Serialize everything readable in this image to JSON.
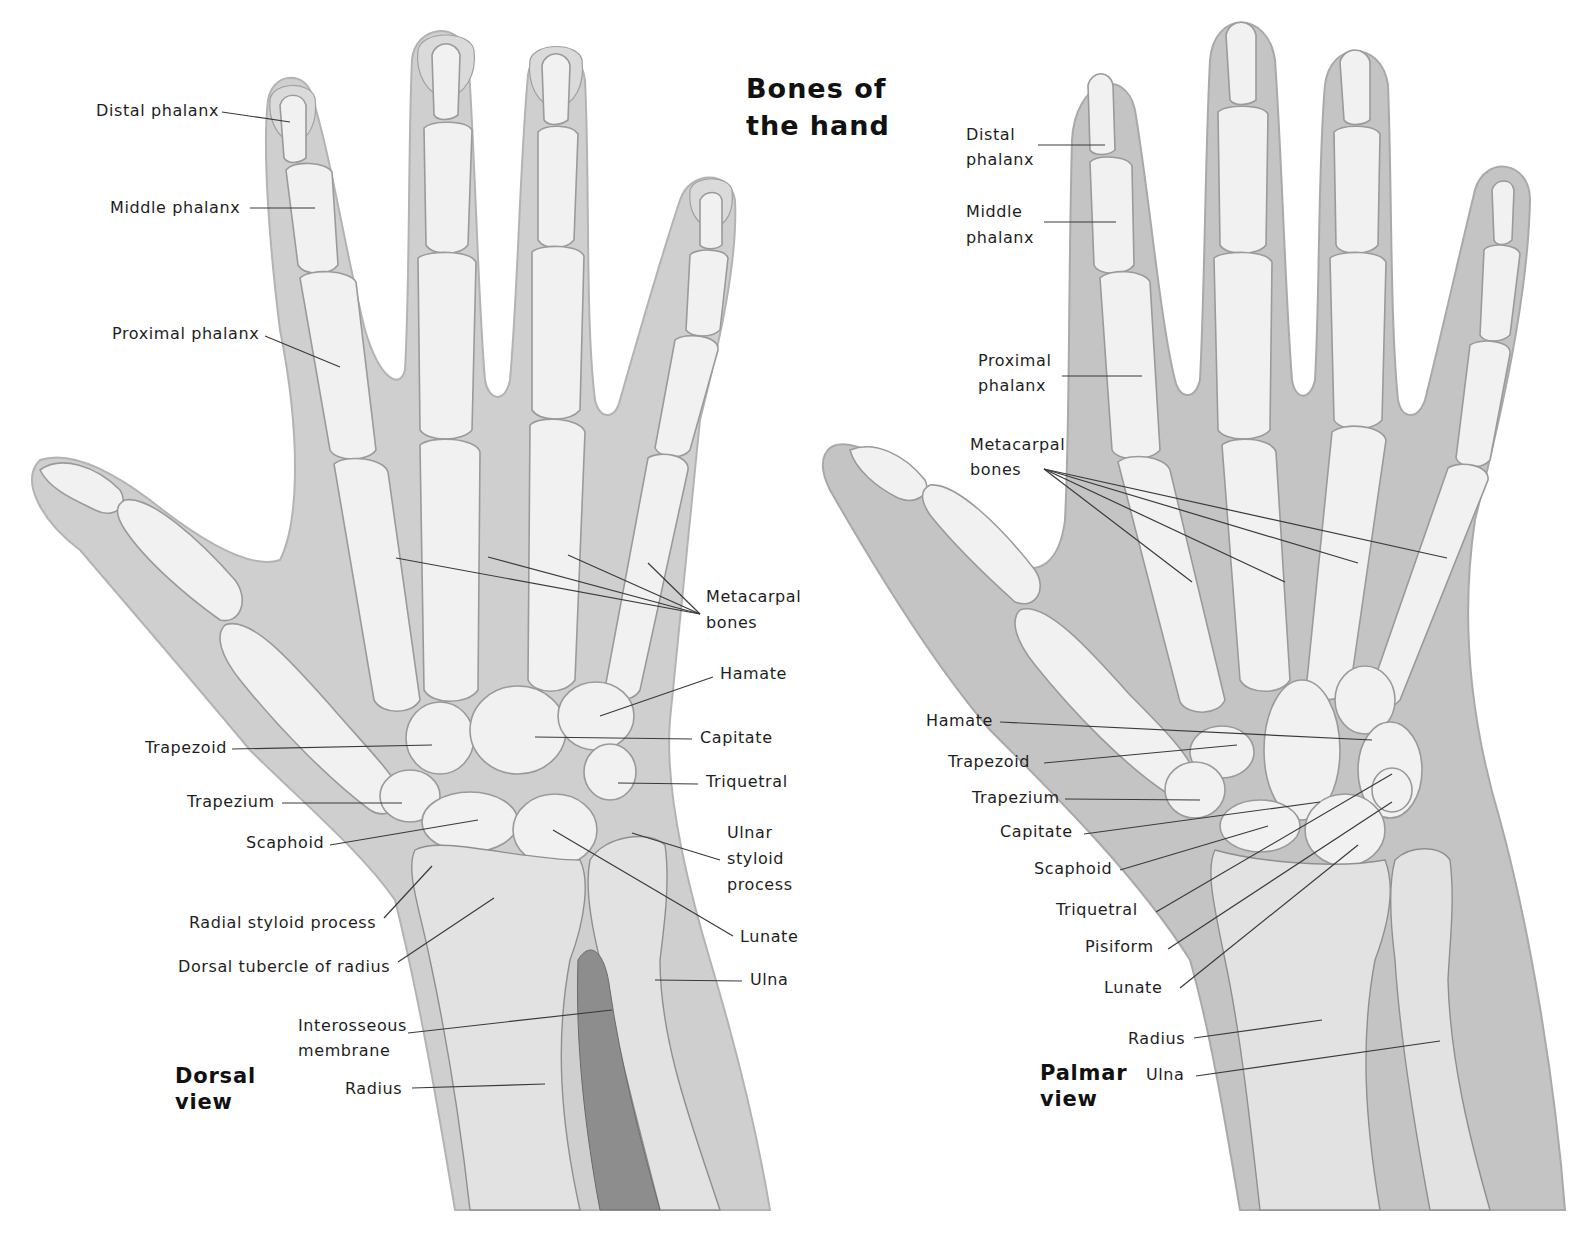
{
  "title": {
    "line1": "Bones of",
    "line2": "the hand"
  },
  "colors": {
    "background": "#ffffff",
    "skin": "#cfcfcf",
    "bone": "#f1f1f1",
    "text": "#1e1e1e",
    "leader_line": "#3a3a3a"
  },
  "dorsal": {
    "view_label": {
      "line1": "Dorsal",
      "line2": "view"
    },
    "labels": {
      "distal_phalanx": "Distal phalanx",
      "middle_phalanx": "Middle phalanx",
      "proximal_phalanx": "Proximal phalanx",
      "metacarpal_1": "Metacarpal",
      "metacarpal_2": "bones",
      "hamate": "Hamate",
      "capitate": "Capitate",
      "triquetral": "Triquetral",
      "ulnar_styloid_1": "Ulnar",
      "ulnar_styloid_2": "styloid",
      "ulnar_styloid_3": "process",
      "lunate": "Lunate",
      "ulna": "Ulna",
      "trapezoid": "Trapezoid",
      "trapezium": "Trapezium",
      "scaphoid": "Scaphoid",
      "radial_styloid": "Radial styloid process",
      "dorsal_tubercle": "Dorsal tubercle of radius",
      "interosseous_1": "Interosseous",
      "interosseous_2": "membrane",
      "radius": "Radius"
    }
  },
  "palmar": {
    "view_label": {
      "line1": "Palmar",
      "line2": "view"
    },
    "labels": {
      "distal_phalanx_1": "Distal",
      "distal_phalanx_2": "phalanx",
      "middle_phalanx_1": "Middle",
      "middle_phalanx_2": "phalanx",
      "proximal_phalanx_1": "Proximal",
      "proximal_phalanx_2": "phalanx",
      "metacarpal_1": "Metacarpal",
      "metacarpal_2": "bones",
      "hamate": "Hamate",
      "trapezoid": "Trapezoid",
      "trapezium": "Trapezium",
      "capitate": "Capitate",
      "scaphoid": "Scaphoid",
      "triquetral": "Triquetral",
      "pisiform": "Pisiform",
      "lunate": "Lunate",
      "radius": "Radius",
      "ulna": "Ulna"
    }
  }
}
